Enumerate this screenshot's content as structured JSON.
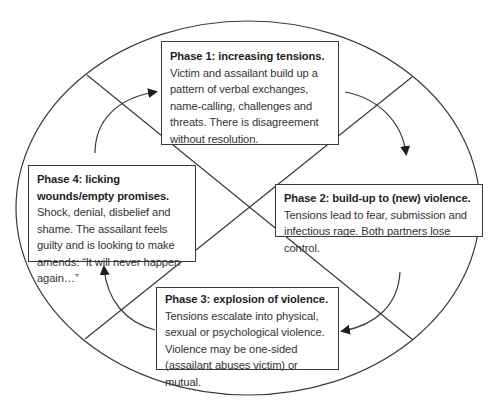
{
  "diagram": {
    "type": "cycle",
    "colors": {
      "stroke": "#3a3a3a",
      "background": "#ffffff",
      "text": "#333333"
    },
    "phases": [
      {
        "id": 1,
        "title": "Phase 1: increasing tensions.",
        "body": "Victim and assailant build up a pattern of verbal exchanges, name-calling, challenges and threats. There is disagreement without resolution."
      },
      {
        "id": 2,
        "title": "Phase 2: build-up to (new) violence.",
        "body": "Tensions lead to fear, submission and infectious rage. Both partners lose control."
      },
      {
        "id": 3,
        "title": "Phase 3: explosion of violence.",
        "body": "Tensions escalate into physical, sexual or psychological violence. Violence may be one-sided (assailant abuses victim) or mutual."
      },
      {
        "id": 4,
        "title": "Phase 4: licking wounds/empty promises.",
        "body": "Shock, denial, disbelief and shame. The assailant feels guilty and is looking to make amends: “It will never happen again…”"
      }
    ],
    "arrows": [
      {
        "from": "phase-4",
        "to": "phase-1",
        "direction": "clockwise"
      },
      {
        "from": "phase-1",
        "to": "phase-2",
        "direction": "clockwise"
      },
      {
        "from": "phase-2",
        "to": "phase-3",
        "direction": "clockwise"
      },
      {
        "from": "phase-3",
        "to": "phase-4",
        "direction": "clockwise"
      }
    ]
  }
}
